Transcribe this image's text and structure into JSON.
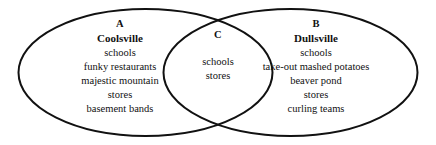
{
  "diagram": {
    "type": "venn",
    "sets": 2,
    "background_color": "#ffffff",
    "stroke_color": "#111111",
    "text_color": "#111111"
  },
  "left_set": {
    "letter": "A",
    "title": "Coolsville",
    "items": [
      "schools",
      "funky restaurants",
      "majestic mountain",
      "stores",
      "basement bands"
    ]
  },
  "right_set": {
    "letter": "B",
    "title": "Dullsville",
    "items": [
      "schools",
      "take-out mashed potatoes",
      "beaver pond",
      "stores",
      "curling teams"
    ]
  },
  "intersection": {
    "letter": "C",
    "items": [
      "schools",
      "stores"
    ]
  }
}
